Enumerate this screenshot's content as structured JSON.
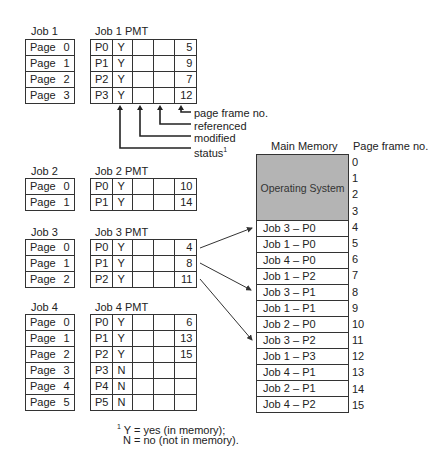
{
  "jobs": [
    {
      "title": "Job 1",
      "pmt_title": "Job 1 PMT",
      "pages": [
        {
          "label": "Page",
          "num": "0"
        },
        {
          "label": "Page",
          "num": "1"
        },
        {
          "label": "Page",
          "num": "2"
        },
        {
          "label": "Page",
          "num": "3"
        }
      ],
      "pmt": [
        {
          "page": "P0",
          "status": "Y",
          "modified": "",
          "referenced": "",
          "frame": "5"
        },
        {
          "page": "P1",
          "status": "Y",
          "modified": "",
          "referenced": "",
          "frame": "9"
        },
        {
          "page": "P2",
          "status": "Y",
          "modified": "",
          "referenced": "",
          "frame": "7"
        },
        {
          "page": "P3",
          "status": "Y",
          "modified": "",
          "referenced": "",
          "frame": "12"
        }
      ]
    },
    {
      "title": "Job 2",
      "pmt_title": "Job 2 PMT",
      "pages": [
        {
          "label": "Page",
          "num": "0"
        },
        {
          "label": "Page",
          "num": "1"
        }
      ],
      "pmt": [
        {
          "page": "P0",
          "status": "Y",
          "modified": "",
          "referenced": "",
          "frame": "10"
        },
        {
          "page": "P1",
          "status": "Y",
          "modified": "",
          "referenced": "",
          "frame": "14"
        }
      ]
    },
    {
      "title": "Job 3",
      "pmt_title": "Job 3 PMT",
      "pages": [
        {
          "label": "Page",
          "num": "0"
        },
        {
          "label": "Page",
          "num": "1"
        },
        {
          "label": "Page",
          "num": "2"
        }
      ],
      "pmt": [
        {
          "page": "P0",
          "status": "Y",
          "modified": "",
          "referenced": "",
          "frame": "4"
        },
        {
          "page": "P1",
          "status": "Y",
          "modified": "",
          "referenced": "",
          "frame": "8"
        },
        {
          "page": "P2",
          "status": "Y",
          "modified": "",
          "referenced": "",
          "frame": "11"
        }
      ]
    },
    {
      "title": "Job 4",
      "pmt_title": "Job 4 PMT",
      "pages": [
        {
          "label": "Page",
          "num": "0"
        },
        {
          "label": "Page",
          "num": "1"
        },
        {
          "label": "Page",
          "num": "2"
        },
        {
          "label": "Page",
          "num": "3"
        },
        {
          "label": "Page",
          "num": "4"
        },
        {
          "label": "Page",
          "num": "5"
        }
      ],
      "pmt": [
        {
          "page": "P0",
          "status": "Y",
          "modified": "",
          "referenced": "",
          "frame": "6"
        },
        {
          "page": "P1",
          "status": "Y",
          "modified": "",
          "referenced": "",
          "frame": "13"
        },
        {
          "page": "P2",
          "status": "Y",
          "modified": "",
          "referenced": "",
          "frame": "15"
        },
        {
          "page": "P3",
          "status": "N",
          "modified": "",
          "referenced": "",
          "frame": ""
        },
        {
          "page": "P4",
          "status": "N",
          "modified": "",
          "referenced": "",
          "frame": ""
        },
        {
          "page": "P5",
          "status": "N",
          "modified": "",
          "referenced": "",
          "frame": ""
        }
      ]
    }
  ],
  "column_callouts": {
    "frame": "page frame no.",
    "referenced": "referenced",
    "modified": "modified",
    "status": "status",
    "status_footnote_mark": "1"
  },
  "main_memory": {
    "title": "Main Memory",
    "frame_header": "Page frame no.",
    "os_label": "Operating System",
    "os_frames": [
      "0",
      "1",
      "2",
      "3"
    ],
    "slots": [
      {
        "frame": "4",
        "content": "Job 3 – P0"
      },
      {
        "frame": "5",
        "content": "Job 1 – P0"
      },
      {
        "frame": "6",
        "content": "Job 4 – P0"
      },
      {
        "frame": "7",
        "content": "Job 1 – P2"
      },
      {
        "frame": "8",
        "content": "Job 3 – P1"
      },
      {
        "frame": "9",
        "content": "Job 1 – P1"
      },
      {
        "frame": "10",
        "content": "Job 2 – P0"
      },
      {
        "frame": "11",
        "content": "Job 3 – P2"
      },
      {
        "frame": "12",
        "content": "Job 1 – P3"
      },
      {
        "frame": "13",
        "content": "Job 4 – P1"
      },
      {
        "frame": "14",
        "content": "Job 2 – P1"
      },
      {
        "frame": "15",
        "content": "Job 4 – P2"
      }
    ]
  },
  "footnote": {
    "mark": "1",
    "line1": "Y = yes (in memory);",
    "line2": "N = no (not in memory)."
  },
  "colors": {
    "os_fill": "#b4b4b4",
    "line": "#333333"
  }
}
